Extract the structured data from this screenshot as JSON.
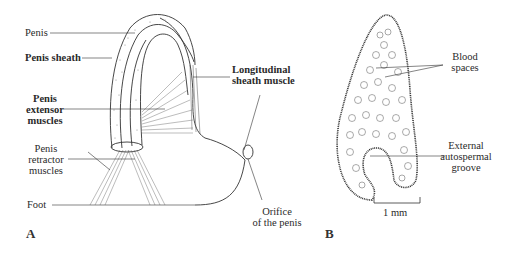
{
  "figure": {
    "panel_a": {
      "letter": "A",
      "labels": {
        "penis": "Penis",
        "penis_sheath": "Penis sheath",
        "extensor": [
          "Penis",
          "extensor",
          "muscles"
        ],
        "retractor": [
          "Penis",
          "retractor",
          "muscles"
        ],
        "foot": "Foot",
        "longitudinal": [
          "Longitudinal",
          "sheath muscle"
        ],
        "orifice": [
          "Orifice",
          "of the penis"
        ]
      }
    },
    "panel_b": {
      "letter": "B",
      "labels": {
        "blood_spaces": [
          "Blood",
          "spaces"
        ],
        "groove": [
          "External",
          "autospermal",
          "groove"
        ],
        "scale_bar": "1 mm"
      }
    },
    "colors": {
      "ink": "#2a2a2a",
      "background": "#ffffff"
    }
  }
}
